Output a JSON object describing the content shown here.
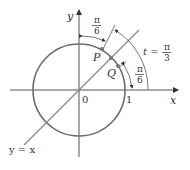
{
  "diagram": {
    "axes": {
      "x_label": "x",
      "y_label": "y"
    },
    "labels": {
      "origin": "0",
      "one": "1",
      "P": "P",
      "Q": "Q",
      "line": "y = x",
      "t_prefix": "t =",
      "pi": "π",
      "three": "3",
      "six": "6"
    },
    "colors": {
      "circle": "#6b6b6b",
      "axes": "#555555",
      "line": "#8a8a8a",
      "point": "#777777",
      "text": "#333333"
    }
  }
}
